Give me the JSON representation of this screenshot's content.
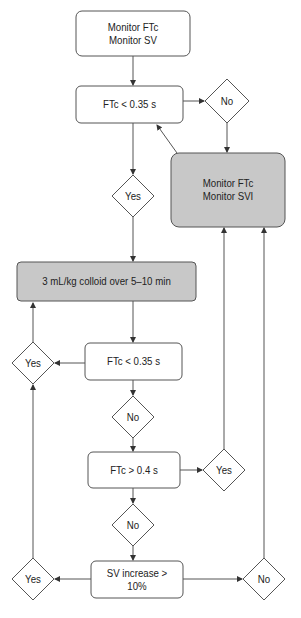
{
  "diagram": {
    "type": "flowchart",
    "colors": {
      "stroke": "#555555",
      "gray_fill": "#c8c8c8",
      "white_fill": "#ffffff",
      "text": "#222222"
    },
    "nodes": {
      "start": {
        "line1": "Monitor FTc",
        "line2": "Monitor SV"
      },
      "check1": {
        "label": "FTc < 0.35 s"
      },
      "no1": {
        "label": "No"
      },
      "svi": {
        "line1": "Monitor FTc",
        "line2": "Monitor SVI"
      },
      "yes1": {
        "label": "Yes"
      },
      "colloid": {
        "label": "3 mL/kg colloid over 5–10 min"
      },
      "check2": {
        "label": "FTc < 0.35 s"
      },
      "yes2": {
        "label": "Yes"
      },
      "no2": {
        "label": "No"
      },
      "check3": {
        "label": "FTc > 0.4 s"
      },
      "yes3": {
        "label": "Yes"
      },
      "no3": {
        "label": "No"
      },
      "check4": {
        "label": "SV increase > 10%"
      },
      "yes4": {
        "label": "Yes"
      },
      "no4": {
        "label": "No"
      }
    }
  }
}
